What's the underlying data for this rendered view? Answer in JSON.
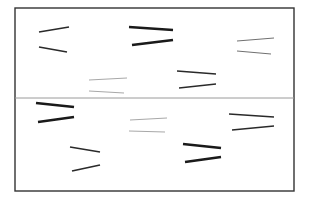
{
  "canvas": {
    "width": 309,
    "height": 208,
    "background": "#ffffff"
  },
  "frame": {
    "x": 15,
    "y": 8,
    "width": 279,
    "height": 183,
    "stroke": "#333333",
    "stroke_width": 1.4
  },
  "divider": {
    "x1": 15,
    "x2": 294,
    "y": 98,
    "stroke": "#9a9a9a",
    "stroke_width": 1
  },
  "styles": {
    "thick": {
      "stroke": "#1a1a1a",
      "width": 2.6
    },
    "medium": {
      "stroke": "#2a2a2a",
      "width": 1.7
    },
    "thin": {
      "stroke": "#707070",
      "width": 1.0
    },
    "faint": {
      "stroke": "#a8a8a8",
      "width": 1.0
    }
  },
  "line_pairs": [
    {
      "id": "pair-1",
      "region": "upper",
      "style": "medium",
      "lines": [
        {
          "x1": 39,
          "y1": 32,
          "x2": 69,
          "y2": 27
        },
        {
          "x1": 39,
          "y1": 47,
          "x2": 67,
          "y2": 52
        }
      ]
    },
    {
      "id": "pair-2",
      "region": "upper",
      "style": "thick",
      "lines": [
        {
          "x1": 129,
          "y1": 27,
          "x2": 173,
          "y2": 30
        },
        {
          "x1": 132,
          "y1": 45,
          "x2": 173,
          "y2": 40
        }
      ]
    },
    {
      "id": "pair-3",
      "region": "upper",
      "style": "thin",
      "lines": [
        {
          "x1": 237,
          "y1": 41,
          "x2": 274,
          "y2": 38
        },
        {
          "x1": 237,
          "y1": 51,
          "x2": 271,
          "y2": 54
        }
      ]
    },
    {
      "id": "pair-4",
      "region": "upper",
      "style": "faint",
      "lines": [
        {
          "x1": 89,
          "y1": 80,
          "x2": 127,
          "y2": 78
        },
        {
          "x1": 89,
          "y1": 91,
          "x2": 124,
          "y2": 93
        }
      ]
    },
    {
      "id": "pair-5",
      "region": "upper",
      "style": "medium",
      "lines": [
        {
          "x1": 177,
          "y1": 71,
          "x2": 216,
          "y2": 74
        },
        {
          "x1": 179,
          "y1": 88,
          "x2": 216,
          "y2": 84
        }
      ]
    },
    {
      "id": "pair-6",
      "region": "lower",
      "style": "thick",
      "lines": [
        {
          "x1": 36,
          "y1": 103,
          "x2": 74,
          "y2": 107
        },
        {
          "x1": 38,
          "y1": 122,
          "x2": 74,
          "y2": 117
        }
      ]
    },
    {
      "id": "pair-7",
      "region": "lower",
      "style": "faint",
      "lines": [
        {
          "x1": 130,
          "y1": 120,
          "x2": 167,
          "y2": 118
        },
        {
          "x1": 129,
          "y1": 131,
          "x2": 165,
          "y2": 132
        }
      ]
    },
    {
      "id": "pair-8",
      "region": "lower",
      "style": "medium",
      "lines": [
        {
          "x1": 229,
          "y1": 114,
          "x2": 274,
          "y2": 117
        },
        {
          "x1": 232,
          "y1": 130,
          "x2": 274,
          "y2": 126
        }
      ]
    },
    {
      "id": "pair-9",
      "region": "lower",
      "style": "medium",
      "lines": [
        {
          "x1": 70,
          "y1": 147,
          "x2": 100,
          "y2": 152
        },
        {
          "x1": 72,
          "y1": 171,
          "x2": 100,
          "y2": 165
        }
      ]
    },
    {
      "id": "pair-10",
      "region": "lower",
      "style": "thick",
      "lines": [
        {
          "x1": 183,
          "y1": 144,
          "x2": 221,
          "y2": 148
        },
        {
          "x1": 185,
          "y1": 162,
          "x2": 221,
          "y2": 157
        }
      ]
    }
  ]
}
